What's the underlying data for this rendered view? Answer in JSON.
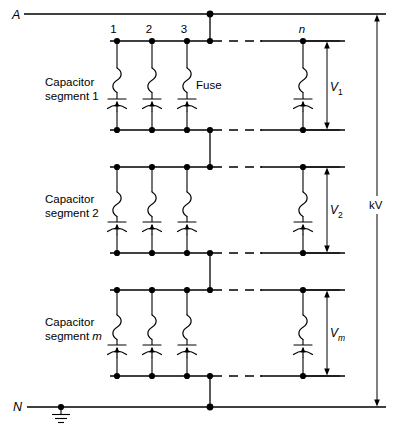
{
  "diagram": {
    "terminals": {
      "line_label": "A",
      "neutral_label": "N",
      "ground_icon": "ground-symbol"
    },
    "overall_voltage_label": "kV",
    "fuse_callout": "Fuse",
    "node_labels": [
      "1",
      "2",
      "3",
      "n"
    ],
    "segments": [
      {
        "name_line1": "Capacitor",
        "name_line2": "segment 1",
        "segment_index": "1",
        "voltage_symbol": "V",
        "voltage_subscript": "1"
      },
      {
        "name_line1": "Capacitor",
        "name_line2": "segment 2",
        "segment_index": "2",
        "voltage_symbol": "V",
        "voltage_subscript": "2"
      },
      {
        "name_line1": "Capacitor",
        "name_line2": "segment m",
        "segment_index": "m",
        "voltage_symbol": "V",
        "voltage_subscript": "m"
      }
    ],
    "colors": {
      "line": "#000000",
      "background": "#ffffff"
    }
  }
}
